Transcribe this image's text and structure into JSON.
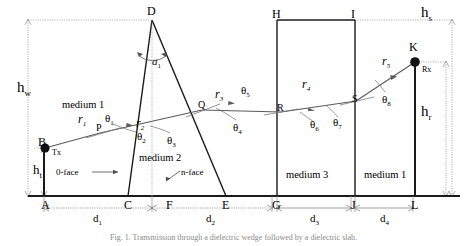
{
  "figure": {
    "caption": "Fig. 1. Transmission through a dielectric wedge followed by a dielectric slab.",
    "media": [
      {
        "id": "medium-1-left",
        "label": "medium 1",
        "x": 62,
        "y": 100
      },
      {
        "id": "medium-2",
        "label": "medium 2",
        "x": 139,
        "y": 153
      },
      {
        "id": "medium-3",
        "label": "medium 3",
        "x": 286,
        "y": 170
      },
      {
        "id": "medium-1-right",
        "label": "medium 1",
        "x": 364,
        "y": 170
      }
    ],
    "points": [
      {
        "id": "A",
        "label": "A",
        "x": 41,
        "y": 199
      },
      {
        "id": "B",
        "label": "B",
        "x": 38,
        "y": 136
      },
      {
        "id": "C",
        "label": "C",
        "x": 124,
        "y": 199
      },
      {
        "id": "D",
        "label": "D",
        "x": 147,
        "y": 5
      },
      {
        "id": "E",
        "label": "E",
        "x": 222,
        "y": 199
      },
      {
        "id": "F",
        "label": "F",
        "x": 166,
        "y": 199
      },
      {
        "id": "G",
        "label": "G",
        "x": 272,
        "y": 199
      },
      {
        "id": "H",
        "label": "H",
        "x": 272,
        "y": 8
      },
      {
        "id": "I",
        "label": "I",
        "x": 351,
        "y": 8
      },
      {
        "id": "J",
        "label": "J",
        "x": 351,
        "y": 199
      },
      {
        "id": "K",
        "label": "K",
        "x": 409,
        "y": 41
      },
      {
        "id": "L",
        "label": "L",
        "x": 411,
        "y": 199
      },
      {
        "id": "P",
        "label": "P",
        "x": 96,
        "y": 123
      },
      {
        "id": "Q",
        "label": "Q",
        "x": 198,
        "y": 100
      },
      {
        "id": "R",
        "label": "R",
        "x": 277,
        "y": 103
      },
      {
        "id": "S",
        "label": "S",
        "x": 352,
        "y": 94
      }
    ],
    "terminals": [
      {
        "id": "tx",
        "label": "Tx",
        "x": 52,
        "y": 149
      },
      {
        "id": "rx",
        "label": "Rx",
        "x": 422,
        "y": 66
      }
    ],
    "faces": [
      {
        "id": "zero-face",
        "label": "0-face",
        "x": 56,
        "y": 172
      },
      {
        "id": "n-face",
        "label": "n-face",
        "x": 181,
        "y": 172
      }
    ],
    "rays": [
      {
        "id": "r1",
        "base": "r",
        "sub": "1",
        "x": 78,
        "y": 113
      },
      {
        "id": "r2",
        "base": "r",
        "sub": "2",
        "x": 136,
        "y": 117
      },
      {
        "id": "r3",
        "base": "r",
        "sub": "3",
        "x": 215,
        "y": 88
      },
      {
        "id": "r4",
        "base": "r",
        "sub": "4",
        "x": 302,
        "y": 78
      },
      {
        "id": "r5",
        "base": "r",
        "sub": "5",
        "x": 382,
        "y": 55
      }
    ],
    "angles": [
      {
        "id": "a1",
        "base": "a",
        "sub": "1",
        "x": 152,
        "y": 56
      },
      {
        "id": "theta1",
        "base": "θ",
        "sub": "1",
        "x": 105,
        "y": 113
      },
      {
        "id": "theta2",
        "base": "θ",
        "sub": "2",
        "x": 137,
        "y": 131
      },
      {
        "id": "theta3",
        "base": "θ",
        "sub": "3",
        "x": 167,
        "y": 135
      },
      {
        "id": "theta4",
        "base": "θ",
        "sub": "4",
        "x": 233,
        "y": 122
      },
      {
        "id": "theta5",
        "base": "θ",
        "sub": "5",
        "x": 241,
        "y": 85
      },
      {
        "id": "theta6",
        "base": "θ",
        "sub": "6",
        "x": 310,
        "y": 119
      },
      {
        "id": "theta7",
        "base": "θ",
        "sub": "7",
        "x": 333,
        "y": 117
      },
      {
        "id": "theta8",
        "base": "θ",
        "sub": "8",
        "x": 382,
        "y": 94
      }
    ],
    "heights": [
      {
        "id": "hw",
        "base": "h",
        "sub": "w",
        "x": 17,
        "y": 80
      },
      {
        "id": "ht",
        "base": "h",
        "sub": "t",
        "x": 33,
        "y": 166
      },
      {
        "id": "hs",
        "base": "h",
        "sub": "s",
        "x": 421,
        "y": 8
      },
      {
        "id": "hr",
        "base": "h",
        "sub": "r",
        "x": 421,
        "y": 110
      }
    ],
    "distances": [
      {
        "id": "d1",
        "base": "d",
        "sub": "1",
        "x": 100,
        "y": 216
      },
      {
        "id": "d2",
        "base": "d",
        "sub": "2",
        "x": 190,
        "y": 216
      },
      {
        "id": "d3",
        "base": "d",
        "sub": "3",
        "x": 306,
        "y": 216
      },
      {
        "id": "d4",
        "base": "d",
        "sub": "4",
        "x": 378,
        "y": 216
      }
    ],
    "colors": {
      "stroke": "#1a1a1a",
      "ray": "#555555",
      "dim": "#666666",
      "background": "#ffffff"
    }
  }
}
